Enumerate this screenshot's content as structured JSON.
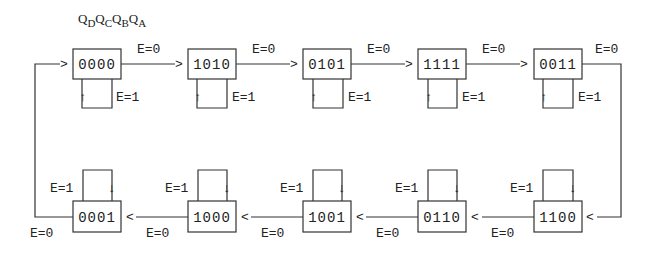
{
  "header": {
    "parts": [
      {
        "base": "Q",
        "sub": "D"
      },
      {
        "base": "Q",
        "sub": "C"
      },
      {
        "base": "Q",
        "sub": "B"
      },
      {
        "base": "Q",
        "sub": "A"
      }
    ]
  },
  "top_row": [
    {
      "state": "0000",
      "hold_label": "E=1",
      "next_label": "E=0"
    },
    {
      "state": "1010",
      "hold_label": "E=1",
      "next_label": "E=0"
    },
    {
      "state": "0101",
      "hold_label": "E=1",
      "next_label": "E=0"
    },
    {
      "state": "1111",
      "hold_label": "E=1",
      "next_label": "E=0"
    },
    {
      "state": "0011",
      "hold_label": "E=1",
      "next_label": "E=0"
    }
  ],
  "bottom_row": [
    {
      "state": "0001",
      "hold_label": "E=1",
      "next_label": "E=0"
    },
    {
      "state": "1000",
      "hold_label": "E=1",
      "next_label": "E=0"
    },
    {
      "state": "1001",
      "hold_label": "E=1",
      "next_label": "E=0"
    },
    {
      "state": "0110",
      "hold_label": "E=1",
      "next_label": "E=0"
    },
    {
      "state": "1100",
      "hold_label": "E=1",
      "next_label": "E=0"
    }
  ],
  "sequence": [
    "0000",
    "1010",
    "0101",
    "1111",
    "0011",
    "1100",
    "0110",
    "1001",
    "1000",
    "0001"
  ],
  "arrow_glyphs": {
    "right": ">",
    "left": "<",
    "up": "↑",
    "down": "↓"
  }
}
